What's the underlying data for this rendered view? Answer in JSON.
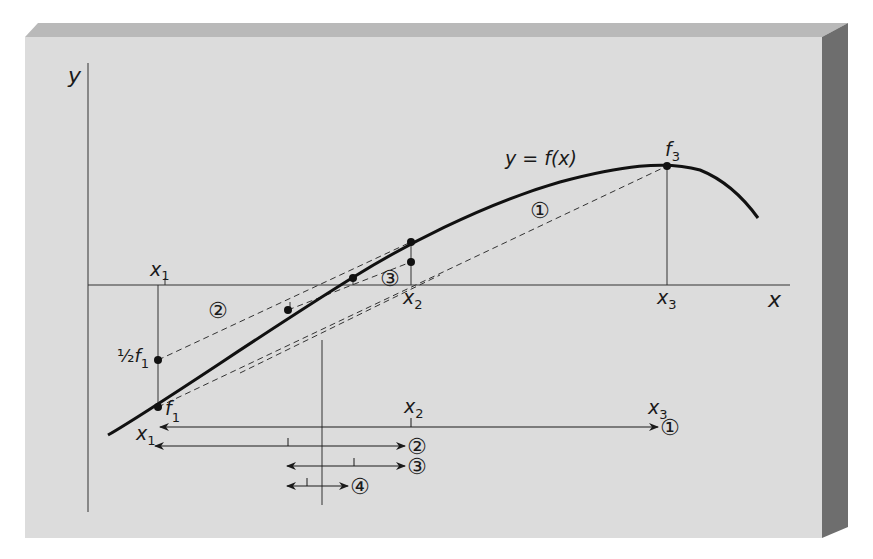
{
  "panel": {
    "face_color": "#dcdcdc",
    "top_bevel_color": "#b4b4b4",
    "side_bevel_color": "#6e6e6e"
  },
  "axes": {
    "y_label": "y",
    "x_label": "x"
  },
  "curve": {
    "label": "y = f(x)",
    "color": "#111111"
  },
  "points": {
    "f1": {
      "label": "f",
      "sub": "1"
    },
    "f3": {
      "label": "f",
      "sub": "3"
    },
    "half_f1": {
      "prefix": "½",
      "label": "f",
      "sub": "1"
    }
  },
  "axis_ticks": {
    "x1": {
      "label": "x",
      "sub": "1"
    },
    "x2": {
      "label": "x",
      "sub": "2"
    },
    "x3": {
      "label": "x",
      "sub": "3"
    }
  },
  "region_markers": {
    "m1": "①",
    "m2": "②",
    "m3": "③"
  },
  "interval_rows": [
    {
      "id": "1",
      "marker": "①",
      "start_label": {
        "label": "x",
        "sub": "1"
      },
      "mid_label": {
        "label": "x",
        "sub": "2"
      },
      "end_label": {
        "label": "x",
        "sub": "3"
      }
    },
    {
      "id": "2",
      "marker": "②"
    },
    {
      "id": "3",
      "marker": "③"
    },
    {
      "id": "4",
      "marker": "④"
    }
  ]
}
